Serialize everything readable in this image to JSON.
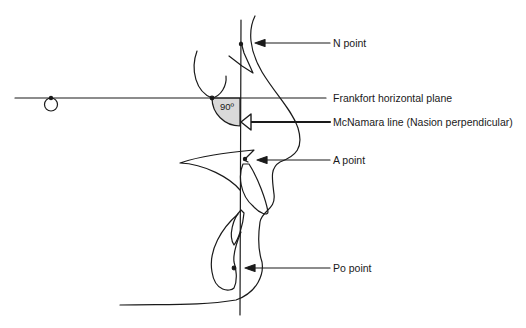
{
  "diagram": {
    "colors": {
      "line": "#1a1a1a",
      "angle_fill": "#d9d9d9",
      "background": "#ffffff"
    },
    "angle": {
      "label": "90º"
    },
    "labels": {
      "n_point": "N point",
      "frankfort": "Frankfort horizontal plane",
      "mcnamara": "McNamara line (Nasion perpendicular)",
      "a_point": "A point",
      "po_point": "Po point"
    }
  }
}
